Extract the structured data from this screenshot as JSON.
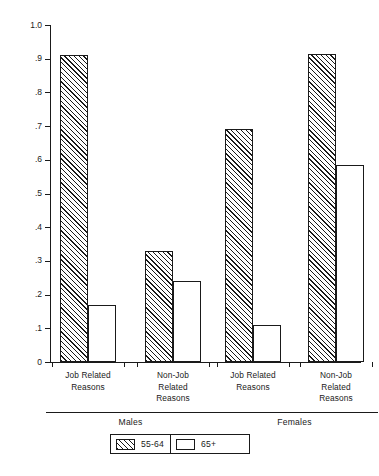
{
  "chart_data": {
    "type": "bar",
    "title": "",
    "subtitle": "",
    "xlabel": "",
    "ylabel": "Millions",
    "ylim": [
      0,
      1.0
    ],
    "ytick_values": [
      1.0,
      0.9,
      0.8,
      0.7,
      0.6,
      0.5,
      0.4,
      0.3,
      0.2,
      0.1,
      0
    ],
    "ytick_labels": [
      "1.0",
      ".9",
      ".8",
      ".7",
      ".6",
      ".5",
      ".4",
      ".3",
      ".2",
      ".1",
      "0"
    ],
    "grid": false,
    "legend_position": "bottom-center",
    "categories": [
      "Job Related Reasons",
      "Non-Job Related Reasons",
      "Job Related Reasons",
      "Non-Job Related Reasons"
    ],
    "category_label_lines": [
      [
        "Job Related",
        "Reasons"
      ],
      [
        "Non-Job",
        "Related",
        "Reasons"
      ],
      [
        "Job Related",
        "Reasons"
      ],
      [
        "Non-Job",
        "Related",
        "Reasons"
      ]
    ],
    "groups": [
      {
        "label": "Males",
        "category_indices": [
          0,
          1
        ]
      },
      {
        "label": "Females",
        "category_indices": [
          2,
          3
        ]
      }
    ],
    "series": [
      {
        "name": "55-64",
        "fill": "diagonal-hatch",
        "color": "#1a1a1a",
        "values": [
          0.91,
          0.33,
          0.69,
          0.915
        ]
      },
      {
        "name": "65+",
        "fill": "white",
        "color": "#ffffff",
        "values": [
          0.17,
          0.24,
          0.11,
          0.585
        ]
      }
    ]
  },
  "legend": {
    "items": [
      {
        "label": "55-64",
        "swatch": "hatched-swatch"
      },
      {
        "label": "65+",
        "swatch": "white-swatch"
      }
    ]
  },
  "axis": {
    "y_title": "Millions"
  },
  "colors": {
    "ink": "#1a1a1a",
    "paper": "#ffffff"
  }
}
